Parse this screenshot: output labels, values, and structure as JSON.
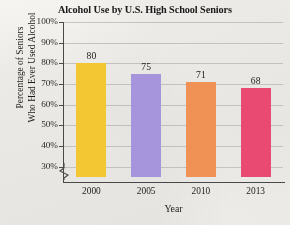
{
  "chart_data": {
    "type": "bar",
    "title": "Alcohol Use by U.S. High School Seniors",
    "xlabel": "Year",
    "ylabel_line1": "Percentage of Seniors",
    "ylabel_line2": "Who Had Ever Used Alcohol",
    "categories": [
      "2000",
      "2005",
      "2010",
      "2013"
    ],
    "values": [
      80,
      75,
      71,
      68
    ],
    "value_labels": [
      "80",
      "75",
      "71",
      "68"
    ],
    "ylim": [
      25,
      100
    ],
    "yticks": [
      30,
      40,
      50,
      60,
      70,
      80,
      90,
      100
    ],
    "ytick_labels": [
      "30%",
      "40%",
      "50%",
      "60%",
      "70%",
      "80%",
      "90%",
      "100%"
    ],
    "grid": true,
    "legend": "none",
    "axis_break": true,
    "bar_colors": [
      "#F3C733",
      "#A695DC",
      "#F09255",
      "#E84A72"
    ],
    "gridline_color": "#c9c7c4",
    "axis_color": "#4a4a4a",
    "background_color": "#f2f1ee"
  }
}
